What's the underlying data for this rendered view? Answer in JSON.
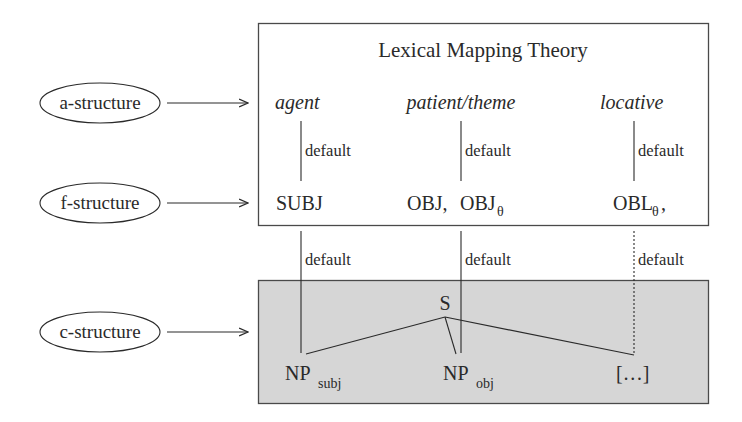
{
  "diagram": {
    "title": "Lexical Mapping Theory",
    "levels": [
      {
        "label": "a-structure"
      },
      {
        "label": "f-structure"
      },
      {
        "label": "c-structure"
      }
    ],
    "roles": [
      "agent",
      "patient/theme",
      "locative"
    ],
    "functions": {
      "subj": "SUBJ",
      "obj": "OBJ,",
      "obj_theta_base": "OBJ",
      "obj_theta_sub": "θ",
      "obl_base": "OBL",
      "obl_sub": "θ",
      "obl_trail": ","
    },
    "edge_label": "default",
    "tree": {
      "root": "S",
      "np_subj_base": "NP",
      "np_subj_sub": "subj",
      "np_obj_base": "NP",
      "np_obj_sub": "obj",
      "other": "[…]"
    },
    "colors": {
      "ink": "#2a2a2a",
      "cstructure_fill": "#d6d6d6",
      "box_border": "#4a4a4a"
    }
  }
}
